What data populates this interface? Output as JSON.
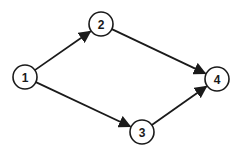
{
  "diagram": {
    "type": "directed-graph",
    "nodes": [
      {
        "id": "1",
        "label": "1",
        "x": 25,
        "y": 77
      },
      {
        "id": "2",
        "label": "2",
        "x": 101,
        "y": 24
      },
      {
        "id": "3",
        "label": "3",
        "x": 142,
        "y": 132
      },
      {
        "id": "4",
        "label": "4",
        "x": 217,
        "y": 79
      }
    ],
    "edges": [
      {
        "from": "1",
        "to": "2"
      },
      {
        "from": "1",
        "to": "3"
      },
      {
        "from": "2",
        "to": "4"
      },
      {
        "from": "3",
        "to": "4"
      }
    ],
    "colors": {
      "stroke": "#1a1a1a",
      "background": "#ffffff"
    }
  }
}
